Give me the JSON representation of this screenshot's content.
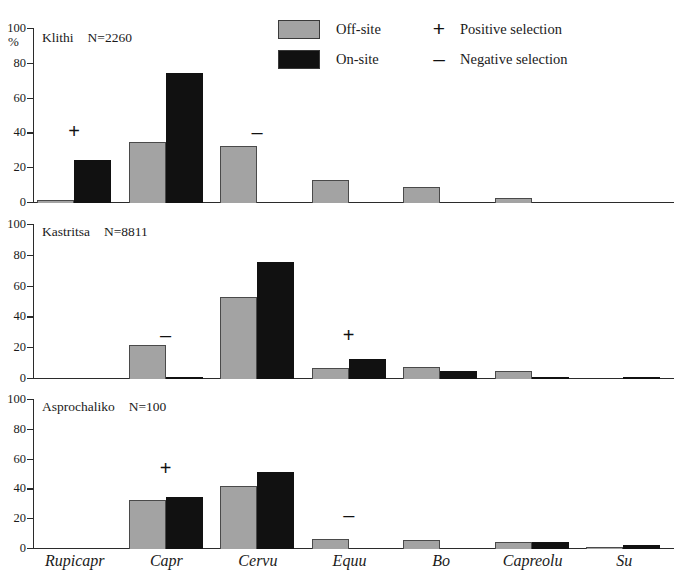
{
  "figure": {
    "y_axis_unit": "%",
    "y_ticks": [
      0,
      20,
      40,
      60,
      80,
      100
    ],
    "categories": [
      "Rupicapr",
      "Capr",
      "Cervu",
      "Equu",
      "Bo",
      "Capreolu",
      "Su"
    ]
  },
  "legend": {
    "items": [
      {
        "key": "off",
        "label": "Off-site",
        "color": "#a3a3a3"
      },
      {
        "key": "on",
        "label": "On-site",
        "color": "#111111"
      }
    ],
    "selection": [
      {
        "mark": "+",
        "label": "Positive selection"
      },
      {
        "mark": "–",
        "label": "Negative selection"
      }
    ]
  },
  "panels": [
    {
      "id": "klithi",
      "site": "Klithi",
      "n_label": "N=2260",
      "off_site": [
        2,
        35,
        33,
        13,
        9,
        3,
        0
      ],
      "on_site": [
        25,
        75,
        0,
        0,
        0,
        0,
        0
      ],
      "markers": [
        {
          "category": "Rupicapr",
          "mark": "+",
          "value": 41
        },
        {
          "category": "Cervu",
          "mark": "–",
          "value": 40
        }
      ]
    },
    {
      "id": "kastritsa",
      "site": "Kastritsa",
      "n_label": "N=8811",
      "off_site": [
        0,
        22,
        53,
        7,
        8,
        5,
        0
      ],
      "on_site": [
        0,
        1,
        76,
        13,
        5,
        0.6,
        0.6
      ],
      "markers": [
        {
          "category": "Capr",
          "mark": "–",
          "value": 28
        },
        {
          "category": "Equu",
          "mark": "+",
          "value": 28
        }
      ]
    },
    {
      "id": "asprochaliko",
      "site": "Asprochaliko",
      "n_label": "N=100",
      "off_site": [
        0,
        33,
        42,
        7,
        6,
        5,
        1
      ],
      "on_site": [
        0,
        35,
        52,
        0,
        0,
        5,
        3
      ],
      "markers": [
        {
          "category": "Capr",
          "mark": "+",
          "value": 54
        },
        {
          "category": "Equu",
          "mark": "–",
          "value": 22
        }
      ]
    }
  ],
  "chart_data": {
    "type": "bar",
    "title": "",
    "xlabel": "",
    "ylabel": "%",
    "ylim": [
      0,
      100
    ],
    "grid": false,
    "legend_position": "top-right",
    "categories": [
      "Rupicapr",
      "Capr",
      "Cervu",
      "Equu",
      "Bo",
      "Capreolu",
      "Su"
    ],
    "panels": [
      {
        "name": "Klithi",
        "annotation": "N=2260",
        "series": [
          {
            "name": "Off-site",
            "values": [
              2,
              35,
              33,
              13,
              9,
              3,
              0
            ]
          },
          {
            "name": "On-site",
            "values": [
              25,
              75,
              0,
              0,
              0,
              0,
              0
            ]
          }
        ],
        "annotations": [
          {
            "category": "Rupicapr",
            "text": "+",
            "meaning": "Positive selection",
            "y": 41
          },
          {
            "category": "Cervu",
            "text": "–",
            "meaning": "Negative selection",
            "y": 40
          }
        ]
      },
      {
        "name": "Kastritsa",
        "annotation": "N=8811",
        "series": [
          {
            "name": "Off-site",
            "values": [
              0,
              22,
              53,
              7,
              8,
              5,
              0
            ]
          },
          {
            "name": "On-site",
            "values": [
              0,
              1,
              76,
              13,
              5,
              0.6,
              0.6
            ]
          }
        ],
        "annotations": [
          {
            "category": "Capr",
            "text": "–",
            "meaning": "Negative selection",
            "y": 28
          },
          {
            "category": "Equu",
            "text": "+",
            "meaning": "Positive selection",
            "y": 28
          }
        ]
      },
      {
        "name": "Asprochaliko",
        "annotation": "N=100",
        "series": [
          {
            "name": "Off-site",
            "values": [
              0,
              33,
              42,
              7,
              6,
              5,
              1
            ]
          },
          {
            "name": "On-site",
            "values": [
              0,
              35,
              52,
              0,
              0,
              5,
              3
            ]
          }
        ],
        "annotations": [
          {
            "category": "Capr",
            "text": "+",
            "meaning": "Positive selection",
            "y": 54
          },
          {
            "category": "Equu",
            "text": "–",
            "meaning": "Negative selection",
            "y": 22
          }
        ]
      }
    ]
  }
}
